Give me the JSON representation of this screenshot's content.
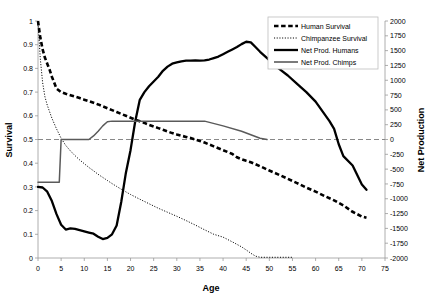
{
  "chart_data": {
    "type": "line",
    "title": "",
    "xlabel": "Age",
    "ylabel": "Survival",
    "y2label": "Net Production",
    "xlim": [
      0,
      75
    ],
    "ylim": [
      0,
      1
    ],
    "y2lim": [
      -2000,
      2000
    ],
    "grid": false,
    "legend_position": "top-right",
    "xticks": [
      0,
      5,
      10,
      15,
      20,
      25,
      30,
      35,
      40,
      45,
      50,
      55,
      60,
      65,
      70,
      75
    ],
    "yticks": [
      0,
      0.1,
      0.2,
      0.3,
      0.4,
      0.5,
      0.6,
      0.7,
      0.8,
      0.9,
      1
    ],
    "ytick_labels": [
      "0",
      "0.1",
      "0.2",
      "0.3",
      "0.4",
      "0.5",
      "0.6",
      "0.7",
      "0.8",
      "0.9",
      "1"
    ],
    "y2ticks": [
      -2000,
      -1750,
      -1500,
      -1250,
      -1000,
      -750,
      -500,
      -250,
      0,
      250,
      500,
      750,
      1000,
      1250,
      1500,
      1750,
      2000
    ],
    "y2tick_labels": [
      "-2000",
      "-1750",
      "-1500",
      "-1250",
      "-1000",
      "-750",
      "-500",
      "-250",
      "0",
      "250",
      "500",
      "750",
      "1000",
      "1250",
      "1500",
      "1750",
      "2000"
    ],
    "xtick_labels": [
      "0",
      "5",
      "10",
      "15",
      "20",
      "25",
      "30",
      "35",
      "40",
      "45",
      "50",
      "55",
      "60",
      "65",
      "70",
      "75"
    ],
    "annotations": [
      {
        "name": "zero-net-production-line",
        "axis": "y2",
        "value": 0,
        "style": "dashed"
      }
    ],
    "series": [
      {
        "name": "Human Survival",
        "axis": "left",
        "style": "thick-dashed",
        "color": "#000000",
        "x": [
          0,
          0.5,
          1,
          1.5,
          2,
          2.5,
          3,
          4,
          5,
          6,
          7,
          8,
          9,
          10,
          11,
          12,
          13,
          14,
          15,
          16,
          17,
          18,
          19,
          20,
          21,
          22,
          23,
          24,
          25,
          26,
          27,
          28,
          29,
          30,
          31,
          32,
          33,
          34,
          35,
          36,
          37,
          38,
          39,
          40,
          41,
          42,
          43,
          44,
          45,
          46,
          47,
          48,
          49,
          50,
          52,
          54,
          56,
          58,
          60,
          62,
          64,
          66,
          68,
          70,
          71
        ],
        "y": [
          1.0,
          0.93,
          0.88,
          0.845,
          0.82,
          0.795,
          0.765,
          0.715,
          0.7,
          0.693,
          0.687,
          0.681,
          0.675,
          0.668,
          0.662,
          0.655,
          0.648,
          0.64,
          0.632,
          0.624,
          0.616,
          0.608,
          0.6,
          0.592,
          0.584,
          0.577,
          0.57,
          0.562,
          0.555,
          0.548,
          0.541,
          0.534,
          0.527,
          0.521,
          0.516,
          0.511,
          0.506,
          0.5,
          0.494,
          0.487,
          0.479,
          0.471,
          0.463,
          0.455,
          0.447,
          0.439,
          0.425,
          0.417,
          0.41,
          0.404,
          0.396,
          0.387,
          0.378,
          0.369,
          0.352,
          0.334,
          0.316,
          0.297,
          0.28,
          0.261,
          0.243,
          0.222,
          0.195,
          0.175,
          0.17
        ]
      },
      {
        "name": "Chimpanzee Survival",
        "axis": "left",
        "style": "fine-dotted",
        "color": "#000000",
        "x": [
          0,
          0.5,
          1,
          1.5,
          2,
          3,
          4,
          5,
          6,
          7,
          8,
          9,
          10,
          11,
          12,
          13,
          14,
          15,
          16,
          17,
          18,
          19,
          20,
          22,
          24,
          26,
          28,
          30,
          32,
          34,
          36,
          38,
          40,
          42,
          44,
          45,
          46,
          47,
          48,
          50,
          52,
          54,
          55
        ],
        "y": [
          1.0,
          0.84,
          0.74,
          0.68,
          0.645,
          0.59,
          0.545,
          0.505,
          0.475,
          0.452,
          0.432,
          0.414,
          0.398,
          0.382,
          0.368,
          0.353,
          0.34,
          0.327,
          0.314,
          0.302,
          0.29,
          0.279,
          0.268,
          0.248,
          0.229,
          0.21,
          0.193,
          0.176,
          0.158,
          0.139,
          0.119,
          0.1,
          0.088,
          0.068,
          0.047,
          0.034,
          0.02,
          0.008,
          0.003,
          0.003,
          0.003,
          0.003,
          0.003
        ]
      },
      {
        "name": "Net Prod. Humans",
        "axis": "right",
        "style": "thick-solid",
        "color": "#000000",
        "x": [
          0,
          1,
          2,
          3,
          4,
          5,
          6,
          7,
          8,
          9,
          10,
          11,
          12,
          13,
          14,
          15,
          16,
          17,
          18,
          19,
          20,
          21,
          22,
          23,
          24,
          25,
          26,
          27,
          28,
          29,
          30,
          31,
          32,
          33,
          34,
          35,
          36,
          37,
          38,
          39,
          40,
          41,
          42,
          43,
          44,
          45,
          46,
          47,
          48,
          50,
          52,
          54,
          56,
          58,
          60,
          62,
          63,
          64,
          65,
          66,
          68,
          70,
          71
        ],
        "y": [
          -800,
          -810,
          -880,
          -1040,
          -1260,
          -1440,
          -1520,
          -1500,
          -1510,
          -1530,
          -1550,
          -1570,
          -1590,
          -1640,
          -1680,
          -1660,
          -1600,
          -1450,
          -1050,
          -560,
          -180,
          300,
          670,
          800,
          900,
          980,
          1060,
          1160,
          1230,
          1280,
          1300,
          1320,
          1330,
          1330,
          1335,
          1330,
          1335,
          1350,
          1375,
          1400,
          1440,
          1480,
          1520,
          1560,
          1610,
          1650,
          1640,
          1560,
          1480,
          1340,
          1200,
          1080,
          940,
          800,
          640,
          420,
          310,
          180,
          -80,
          -280,
          -440,
          -760,
          -850
        ]
      },
      {
        "name": "Net Prod. Chimps",
        "axis": "right",
        "style": "medium-solid-gray",
        "color": "#5a5a5a",
        "x": [
          0,
          1,
          2,
          3,
          4,
          4.6,
          5,
          6,
          8,
          10,
          11,
          12,
          13,
          14,
          15,
          16,
          20,
          25,
          30,
          35,
          36,
          40,
          44,
          48,
          49.5
        ],
        "y": [
          -720,
          -720,
          -720,
          -720,
          -720,
          -720,
          0,
          0,
          0,
          0,
          0,
          60,
          140,
          230,
          300,
          310,
          310,
          310,
          310,
          310,
          310,
          230,
          140,
          20,
          0
        ]
      }
    ]
  },
  "legend": {
    "entries": [
      {
        "label": "Human Survival",
        "swatch": "thick-dashed-black"
      },
      {
        "label": "Chimpanzee Survival",
        "swatch": "fine-dotted-black"
      },
      {
        "label": "Net Prod. Humans",
        "swatch": "thick-solid-black"
      },
      {
        "label": "Net Prod. Chimps",
        "swatch": "medium-solid-gray"
      }
    ]
  },
  "colors": {
    "human": "#000000",
    "chimp": "#000000",
    "netprod_humans": "#000000",
    "netprod_chimps": "#5a5a5a",
    "axis": "#999999",
    "zero_line": "#888888"
  }
}
